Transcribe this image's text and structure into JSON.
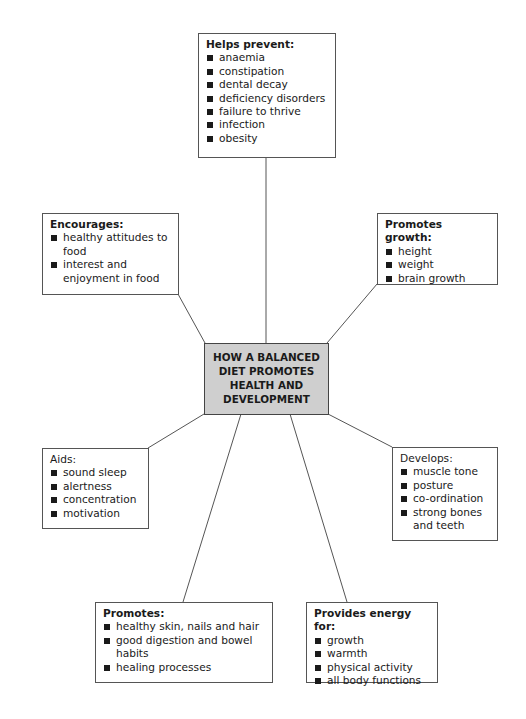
{
  "diagram": {
    "center": {
      "lines": [
        "HOW A BALANCED",
        "DIET PROMOTES",
        "HEALTH AND",
        "DEVELOPMENT"
      ]
    },
    "boxes": {
      "helps_prevent": {
        "title": "Helps prevent:",
        "items": [
          "anaemia",
          "constipation",
          "dental decay",
          "deficiency disorders",
          "failure to thrive",
          "infection",
          "obesity"
        ]
      },
      "encourages": {
        "title": "Encourages:",
        "items": [
          "healthy attitudes to food",
          "interest and enjoyment in food"
        ]
      },
      "promotes_growth": {
        "title": "Promotes growth:",
        "items": [
          "height",
          "weight",
          "brain growth"
        ]
      },
      "aids": {
        "title": "Aids:",
        "items": [
          "sound sleep",
          "alertness",
          "concentration",
          "motivation"
        ]
      },
      "develops": {
        "title": "Develops:",
        "items": [
          "muscle tone",
          "posture",
          "co-ordination",
          "strong bones and teeth"
        ]
      },
      "promotes": {
        "title": "Promotes:",
        "items": [
          "healthy skin, nails and hair",
          "good digestion and bowel habits",
          "healing processes"
        ]
      },
      "provides_energy": {
        "title": "Provides energy for:",
        "items": [
          "growth",
          "warmth",
          "physical activity",
          "all body functions"
        ]
      }
    },
    "colors": {
      "center_fill": "#cfcfcf",
      "line": "#555555",
      "text": "#1a1a1a"
    }
  }
}
